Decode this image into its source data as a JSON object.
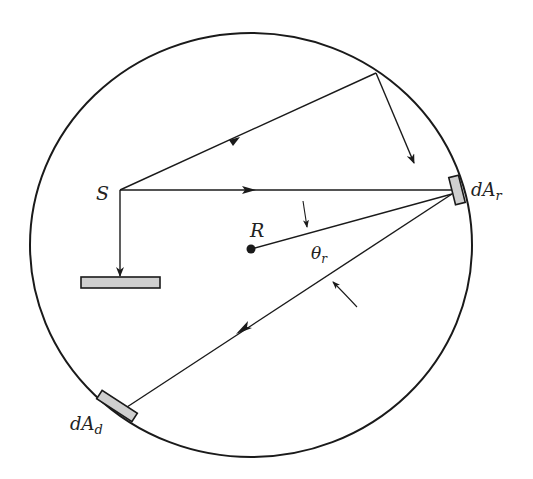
{
  "diagram": {
    "type": "integrating-sphere",
    "colors": {
      "stroke": "#1a1a1a",
      "patch_fill": "#cfcfcf",
      "background": "#ffffff"
    },
    "labels": {
      "source": "S",
      "center": "R",
      "angle_symbol": "θ",
      "angle_sub": "r",
      "reflect_area_main": "dA",
      "reflect_area_sub": "r",
      "detector_area_main": "dA",
      "detector_area_sub": "d"
    },
    "elements": [
      {
        "name": "sphere-wall",
        "kind": "circle"
      },
      {
        "name": "source-point",
        "label": "S"
      },
      {
        "name": "baffle",
        "kind": "rectangle"
      },
      {
        "name": "center-point",
        "label": "R"
      },
      {
        "name": "reflecting-element",
        "label": "dA_r"
      },
      {
        "name": "detector-element",
        "label": "dA_d"
      },
      {
        "name": "angle-theta-r",
        "label": "θ_r"
      }
    ]
  }
}
